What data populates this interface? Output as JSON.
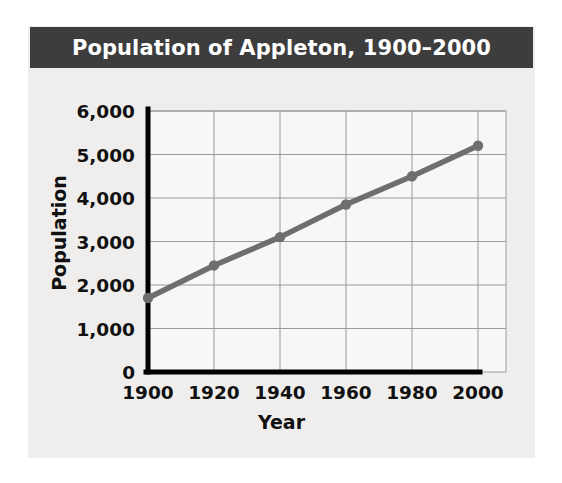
{
  "chart_data": {
    "type": "line",
    "title": "Population of Appleton, 1900–2000",
    "xlabel": "Year",
    "ylabel": "Population",
    "x": [
      1900,
      1920,
      1940,
      1960,
      1980,
      2000
    ],
    "values": [
      1700,
      2450,
      3100,
      3850,
      4500,
      5200
    ],
    "series": [
      {
        "name": "Population of Appleton",
        "values": [
          1700,
          2450,
          3100,
          3850,
          4500,
          5200
        ]
      }
    ],
    "xtick_labels": [
      "1900",
      "1920",
      "1940",
      "1960",
      "1980",
      "2000"
    ],
    "ytick_labels": [
      "0",
      "1,000",
      "2,000",
      "3,000",
      "4,000",
      "5,000",
      "6,000"
    ],
    "ytick_values": [
      0,
      1000,
      2000,
      3000,
      4000,
      5000,
      6000
    ],
    "xlim": [
      1900,
      2000
    ],
    "ylim": [
      0,
      6000
    ],
    "grid": true,
    "legend": "none",
    "colors": {
      "title_bar_background": "#3d3d3d",
      "title_text": "#ffffff",
      "panel_background": "#efeeec",
      "plot_background": "#f7f7f5",
      "gridline": "#9a9a9a",
      "axis": "#000000",
      "series_line": "#6e6e6e",
      "marker": "#6e6e6e",
      "text": "#111111"
    }
  }
}
